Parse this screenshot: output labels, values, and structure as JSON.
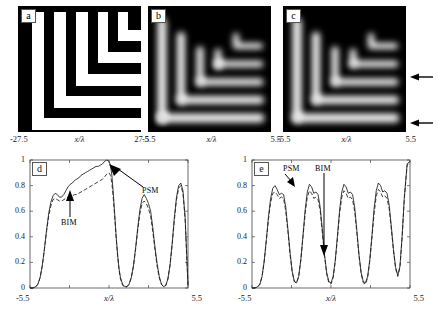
{
  "figure": {
    "panels": [
      {
        "tag": "a",
        "kind": "mask-image",
        "description": "binary nested elbow (L-shaped) mask pattern, white bars on black field",
        "axis": {
          "left": "-27.5",
          "right": "27.5",
          "name": "x/λ"
        }
      },
      {
        "tag": "b",
        "kind": "aerial-image",
        "description": "blurred grayscale aerial image of nested elbow pattern",
        "axis": {
          "left": "-5.5",
          "right": "5.5",
          "name": "x/λ"
        }
      },
      {
        "tag": "c",
        "kind": "aerial-image",
        "description": "blurred grayscale aerial image of nested elbow pattern with two cut-line markers",
        "axis": {
          "left": "-5.5",
          "right": "5.5",
          "name": "x/λ"
        }
      }
    ],
    "markers": [
      {
        "name": "upper-cutline-arrow",
        "direction": "left"
      },
      {
        "name": "lower-cutline-arrow",
        "direction": "left"
      }
    ]
  },
  "chart_data": [
    {
      "type": "line",
      "tag": "d",
      "title": "",
      "xlabel": "x/λ",
      "ylabel": "",
      "xlim": [
        -5.5,
        5.5
      ],
      "ylim": [
        0,
        1
      ],
      "xticklabels": [
        "-5.5",
        "5.5"
      ],
      "yticklabels": [
        "0",
        "0.2",
        "0.4",
        "0.6",
        "0.8",
        "1"
      ],
      "ytickvalues": [
        0,
        0.2,
        0.4,
        0.6,
        0.8,
        1
      ],
      "grid": false,
      "legend_position": "inline-annotations",
      "annotations": [
        {
          "text": "PSM",
          "points_to": "solid-curve-main-peak"
        },
        {
          "text": "BIM",
          "points_to": "dashed-curve-plateau"
        }
      ],
      "series": [
        {
          "name": "PSM",
          "style": "solid",
          "x": [
            -5.5,
            -5.3,
            -5.1,
            -4.95,
            -4.8,
            -4.65,
            -4.5,
            -4.35,
            -4.2,
            -4.05,
            -3.9,
            -3.75,
            -3.6,
            -3.45,
            -3.3,
            -3.15,
            -3.0,
            -2.85,
            -2.7,
            -2.55,
            -2.4,
            -2.25,
            -2.1,
            -1.95,
            -1.8,
            -1.65,
            -1.5,
            -1.35,
            -1.2,
            -1.05,
            -0.9,
            -0.75,
            -0.6,
            -0.45,
            -0.3,
            -0.15,
            0.0,
            0.1,
            0.2,
            0.3,
            0.4,
            0.5,
            0.6,
            0.7,
            0.8,
            0.95,
            1.1,
            1.25,
            1.4,
            1.55,
            1.7,
            1.85,
            2.0,
            2.15,
            2.3,
            2.45,
            2.6,
            2.75,
            2.9,
            3.05,
            3.2,
            3.35,
            3.5,
            3.65,
            3.8,
            3.95,
            4.1,
            4.25,
            4.4,
            4.55,
            4.7,
            4.85,
            5.0,
            5.15,
            5.3,
            5.5
          ],
          "y": [
            0.0,
            0.0,
            0.01,
            0.03,
            0.08,
            0.17,
            0.3,
            0.45,
            0.58,
            0.67,
            0.72,
            0.74,
            0.73,
            0.71,
            0.71,
            0.73,
            0.76,
            0.79,
            0.81,
            0.82,
            0.84,
            0.85,
            0.86,
            0.88,
            0.89,
            0.9,
            0.91,
            0.92,
            0.93,
            0.94,
            0.95,
            0.95,
            0.96,
            0.97,
            0.99,
            1.0,
            0.99,
            0.96,
            0.88,
            0.74,
            0.57,
            0.4,
            0.26,
            0.15,
            0.08,
            0.03,
            0.01,
            0.01,
            0.03,
            0.08,
            0.17,
            0.31,
            0.47,
            0.61,
            0.7,
            0.73,
            0.7,
            0.66,
            0.6,
            0.47,
            0.32,
            0.19,
            0.09,
            0.03,
            0.01,
            0.02,
            0.07,
            0.18,
            0.35,
            0.55,
            0.71,
            0.8,
            0.82,
            0.76,
            0.55,
            0.02
          ]
        },
        {
          "name": "BIM",
          "style": "dashed",
          "x": [
            -5.5,
            -5.3,
            -5.1,
            -4.95,
            -4.8,
            -4.65,
            -4.5,
            -4.35,
            -4.2,
            -4.05,
            -3.9,
            -3.75,
            -3.6,
            -3.45,
            -3.3,
            -3.15,
            -3.0,
            -2.85,
            -2.7,
            -2.55,
            -2.4,
            -2.25,
            -2.1,
            -1.95,
            -1.8,
            -1.65,
            -1.5,
            -1.35,
            -1.2,
            -1.05,
            -0.9,
            -0.75,
            -0.6,
            -0.45,
            -0.3,
            -0.15,
            0.0,
            0.1,
            0.2,
            0.3,
            0.4,
            0.5,
            0.6,
            0.7,
            0.8,
            0.95,
            1.1,
            1.25,
            1.4,
            1.55,
            1.7,
            1.85,
            2.0,
            2.15,
            2.3,
            2.45,
            2.6,
            2.75,
            2.9,
            3.05,
            3.2,
            3.35,
            3.5,
            3.65,
            3.8,
            3.95,
            4.1,
            4.25,
            4.4,
            4.55,
            4.7,
            4.85,
            5.0,
            5.15,
            5.3,
            5.5
          ],
          "y": [
            0.0,
            0.0,
            0.01,
            0.03,
            0.08,
            0.17,
            0.3,
            0.44,
            0.56,
            0.64,
            0.69,
            0.7,
            0.69,
            0.68,
            0.68,
            0.69,
            0.7,
            0.71,
            0.72,
            0.72,
            0.73,
            0.73,
            0.74,
            0.75,
            0.76,
            0.77,
            0.78,
            0.79,
            0.8,
            0.81,
            0.82,
            0.83,
            0.84,
            0.85,
            0.87,
            0.89,
            0.9,
            0.88,
            0.82,
            0.7,
            0.55,
            0.39,
            0.25,
            0.14,
            0.07,
            0.02,
            0.01,
            0.01,
            0.03,
            0.08,
            0.17,
            0.3,
            0.45,
            0.58,
            0.66,
            0.68,
            0.66,
            0.62,
            0.56,
            0.44,
            0.3,
            0.17,
            0.08,
            0.03,
            0.01,
            0.02,
            0.07,
            0.18,
            0.34,
            0.53,
            0.69,
            0.78,
            0.8,
            0.74,
            0.54,
            0.02
          ]
        }
      ]
    },
    {
      "type": "line",
      "tag": "e",
      "title": "",
      "xlabel": "x/λ",
      "ylabel": "",
      "xlim": [
        -5.5,
        5.5
      ],
      "ylim": [
        0,
        1
      ],
      "xticklabels": [
        "-5.5",
        "5.5"
      ],
      "yticklabels": [
        "0",
        "0.2",
        "0.4",
        "0.6",
        "0.8",
        "1"
      ],
      "ytickvalues": [
        0,
        0.2,
        0.4,
        0.6,
        0.8,
        1
      ],
      "grid": false,
      "legend_position": "inline-annotations",
      "annotations": [
        {
          "text": "PSM",
          "points_to": "solid-curve-first-peak"
        },
        {
          "text": "BIM",
          "points_to": "dashed-curve-third-valley"
        }
      ],
      "series": [
        {
          "name": "PSM",
          "style": "solid",
          "x": [
            -5.5,
            -5.3,
            -5.1,
            -4.95,
            -4.8,
            -4.65,
            -4.5,
            -4.35,
            -4.2,
            -4.05,
            -3.9,
            -3.75,
            -3.6,
            -3.45,
            -3.3,
            -3.15,
            -3.0,
            -2.85,
            -2.7,
            -2.55,
            -2.4,
            -2.25,
            -2.1,
            -1.95,
            -1.8,
            -1.65,
            -1.5,
            -1.35,
            -1.2,
            -1.05,
            -0.9,
            -0.75,
            -0.6,
            -0.45,
            -0.3,
            -0.15,
            0.0,
            0.15,
            0.3,
            0.45,
            0.6,
            0.75,
            0.9,
            1.05,
            1.2,
            1.35,
            1.5,
            1.65,
            1.8,
            1.95,
            2.1,
            2.25,
            2.4,
            2.55,
            2.7,
            2.85,
            3.0,
            3.15,
            3.3,
            3.45,
            3.6,
            3.75,
            3.9,
            4.05,
            4.2,
            4.35,
            4.5,
            4.65,
            4.8,
            4.95,
            5.1,
            5.3,
            5.5
          ],
          "y": [
            0.0,
            0.0,
            0.01,
            0.03,
            0.09,
            0.21,
            0.38,
            0.56,
            0.7,
            0.78,
            0.8,
            0.77,
            0.73,
            0.74,
            0.73,
            0.63,
            0.46,
            0.28,
            0.13,
            0.05,
            0.04,
            0.09,
            0.22,
            0.41,
            0.61,
            0.75,
            0.81,
            0.79,
            0.74,
            0.75,
            0.73,
            0.63,
            0.45,
            0.26,
            0.12,
            0.05,
            0.04,
            0.09,
            0.22,
            0.41,
            0.61,
            0.75,
            0.81,
            0.79,
            0.74,
            0.75,
            0.73,
            0.63,
            0.45,
            0.26,
            0.12,
            0.05,
            0.04,
            0.09,
            0.22,
            0.41,
            0.62,
            0.76,
            0.82,
            0.8,
            0.75,
            0.76,
            0.74,
            0.65,
            0.48,
            0.3,
            0.16,
            0.1,
            0.17,
            0.4,
            0.7,
            0.97,
            0.99
          ]
        },
        {
          "name": "BIM",
          "style": "dashed",
          "x": [
            -5.5,
            -5.3,
            -5.1,
            -4.95,
            -4.8,
            -4.65,
            -4.5,
            -4.35,
            -4.2,
            -4.05,
            -3.9,
            -3.75,
            -3.6,
            -3.45,
            -3.3,
            -3.15,
            -3.0,
            -2.85,
            -2.7,
            -2.55,
            -2.4,
            -2.25,
            -2.1,
            -1.95,
            -1.8,
            -1.65,
            -1.5,
            -1.35,
            -1.2,
            -1.05,
            -0.9,
            -0.75,
            -0.6,
            -0.45,
            -0.3,
            -0.15,
            0.0,
            0.15,
            0.3,
            0.45,
            0.6,
            0.75,
            0.9,
            1.05,
            1.2,
            1.35,
            1.5,
            1.65,
            1.8,
            1.95,
            2.1,
            2.25,
            2.4,
            2.55,
            2.7,
            2.85,
            3.0,
            3.15,
            3.3,
            3.45,
            3.6,
            3.75,
            3.9,
            4.05,
            4.2,
            4.35,
            4.5,
            4.65,
            4.8,
            4.95,
            5.1,
            5.3,
            5.5
          ],
          "y": [
            0.0,
            0.0,
            0.01,
            0.03,
            0.09,
            0.21,
            0.37,
            0.54,
            0.67,
            0.74,
            0.75,
            0.73,
            0.7,
            0.71,
            0.7,
            0.6,
            0.44,
            0.26,
            0.12,
            0.05,
            0.04,
            0.09,
            0.22,
            0.4,
            0.58,
            0.71,
            0.76,
            0.74,
            0.7,
            0.71,
            0.69,
            0.6,
            0.43,
            0.25,
            0.11,
            0.04,
            0.03,
            0.08,
            0.21,
            0.39,
            0.58,
            0.71,
            0.76,
            0.74,
            0.7,
            0.71,
            0.69,
            0.6,
            0.43,
            0.25,
            0.11,
            0.04,
            0.03,
            0.08,
            0.21,
            0.39,
            0.58,
            0.72,
            0.77,
            0.75,
            0.71,
            0.72,
            0.7,
            0.62,
            0.46,
            0.29,
            0.15,
            0.09,
            0.16,
            0.39,
            0.69,
            0.96,
            0.98
          ]
        }
      ]
    }
  ]
}
